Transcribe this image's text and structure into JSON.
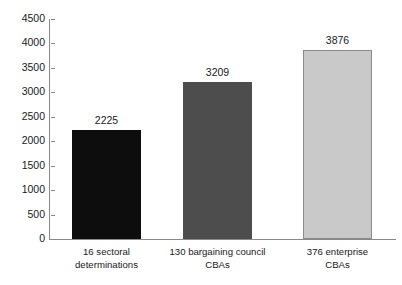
{
  "chart_data": {
    "type": "bar",
    "title": "",
    "subtitle": "",
    "xlabel": "",
    "ylabel": "",
    "categories": [
      "16 sectoral determinations",
      "130 bargaining council CBAs",
      "376 enterprise CBAs"
    ],
    "category_lines": [
      [
        "16 sectoral",
        "determinations"
      ],
      [
        "130 bargaining council",
        "CBAs"
      ],
      [
        "376 enterprise",
        "CBAs"
      ]
    ],
    "values": [
      2225,
      3209,
      3876
    ],
    "value_labels": [
      "2225",
      "3209",
      "3876"
    ],
    "bar_colors": [
      "#0d0d0d",
      "#4d4d4d",
      "#c9c9c9"
    ],
    "bar_border_colors": [
      "#0d0d0d",
      "#4d4d4d",
      "#8a8a8a"
    ],
    "ylim": [
      0,
      4500
    ],
    "ytick_values": [
      0,
      500,
      1000,
      1500,
      2000,
      2500,
      3000,
      3500,
      4000,
      4500
    ],
    "ytick_labels": [
      "0",
      "500",
      "1000",
      "1500",
      "2000",
      "2500",
      "3000",
      "3500",
      "4000",
      "4500"
    ],
    "grid": false,
    "legend": null,
    "axis_color": "#8a8a8a",
    "text_color": "#1a1a1a",
    "background": "#ffffff"
  }
}
